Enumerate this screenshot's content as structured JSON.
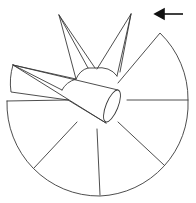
{
  "figure": {
    "stroke_color": "#3a3a3a",
    "background": "#ffffff",
    "arrow": {
      "direction": "left",
      "icon": "arrow-left-icon",
      "color": "#111111"
    },
    "parts": [
      {
        "name": "disc-sector",
        "radial_lines": 4
      },
      {
        "name": "dome-hub"
      },
      {
        "name": "left-spike"
      },
      {
        "name": "right-spike"
      },
      {
        "name": "horizontal-cone"
      },
      {
        "name": "left-wedge"
      }
    ]
  }
}
